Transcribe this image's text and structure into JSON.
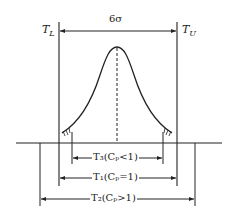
{
  "diagram": {
    "spread_label": "6σ",
    "lower_limit": {
      "symbol": "T",
      "sub": "L"
    },
    "upper_limit": {
      "symbol": "T",
      "sub": "U"
    },
    "ranges": [
      {
        "name": "T3",
        "symbol": "T",
        "sub": "3",
        "condition": "(Cp<1)",
        "text": "T₃(Cₚ<1)"
      },
      {
        "name": "T1",
        "symbol": "T",
        "sub": "1",
        "condition": "(Cp=1)",
        "text": "T₁(Cₚ=1)"
      },
      {
        "name": "T2",
        "symbol": "T",
        "sub": "2",
        "condition": "(Cp>1)",
        "text": "T₂(Cₚ>1)"
      }
    ],
    "colors": {
      "line": "#222222",
      "background": "#ffffff"
    }
  }
}
